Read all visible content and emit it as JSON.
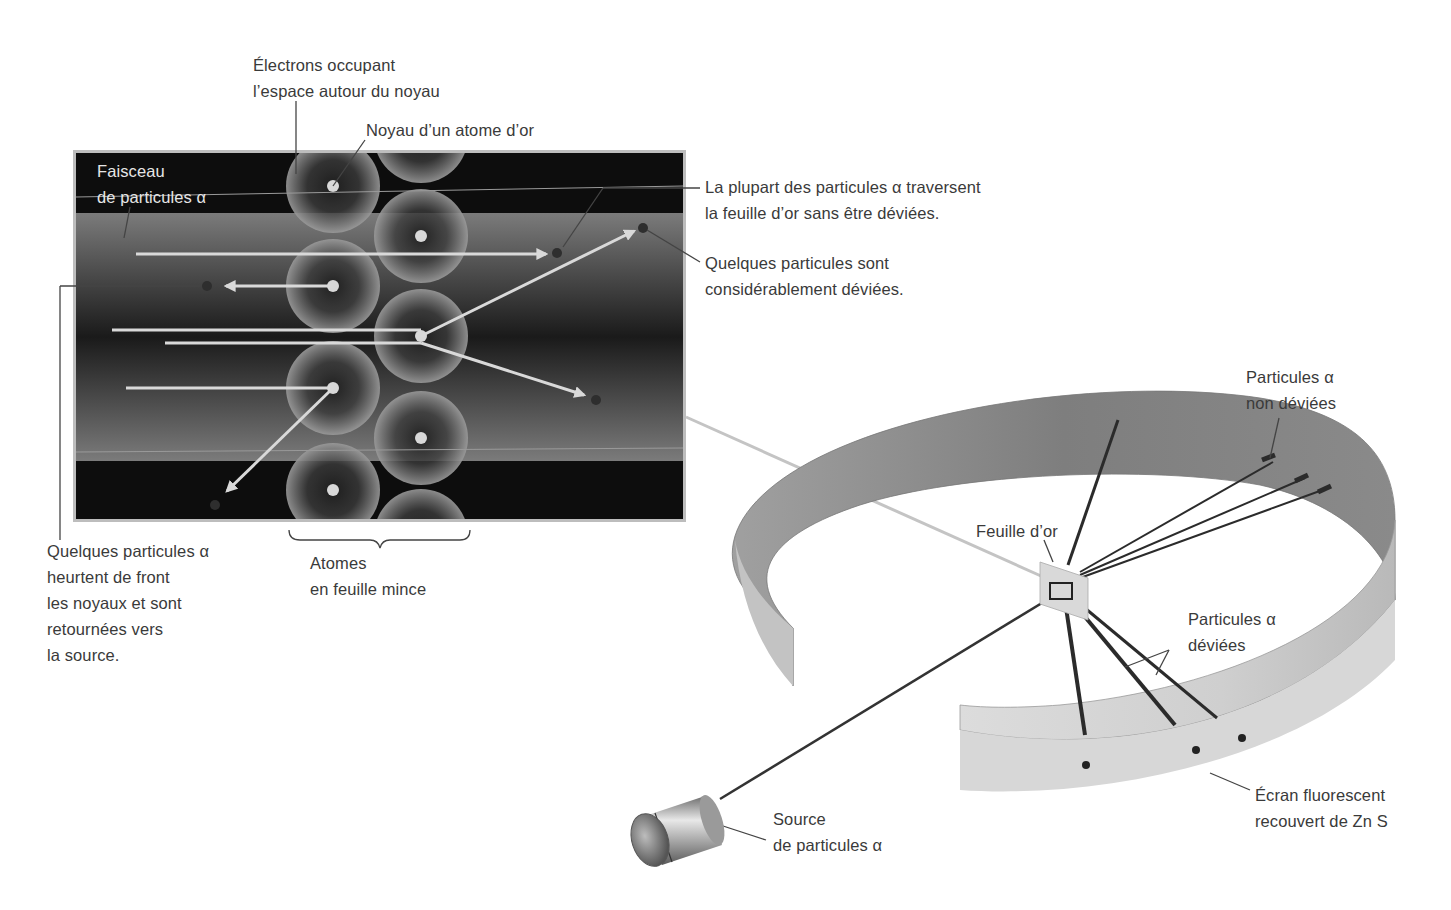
{
  "inset": {
    "labels": {
      "electrons": [
        "Électrons occupant",
        "l’espace autour du noyau"
      ],
      "nucleus": "Noyau d’un atome d’or",
      "beam": [
        "Faisceau",
        "de particules α"
      ],
      "most_pass": [
        "La plupart des particules α traversent",
        "la feuille d’or sans être déviées."
      ],
      "some_deflected": [
        "Quelques particules sont",
        "considérablement déviées."
      ],
      "head_on": [
        "Quelques particules α",
        "heurtent de front",
        "les noyaux et sont",
        "retournées vers",
        "la source."
      ],
      "atoms": [
        "Atomes",
        "en feuille mince"
      ]
    }
  },
  "apparatus": {
    "labels": {
      "foil": "Feuille d’or",
      "undeflected": [
        "Particules α",
        "non déviées"
      ],
      "deflected": [
        "Particules α",
        "déviées"
      ],
      "screen": [
        "Écran fluorescent",
        "recouvert de Zn S"
      ],
      "source": [
        "Source",
        "de particules α"
      ]
    }
  },
  "colors": {
    "inset_dark": "#0d0d0d",
    "inset_band": "#6a6a6a",
    "ring_outer": "#8a8a8a",
    "ring_inner": "#c8c8c8",
    "text": "#3a3a3a",
    "arrow": "#d9d9d9"
  }
}
